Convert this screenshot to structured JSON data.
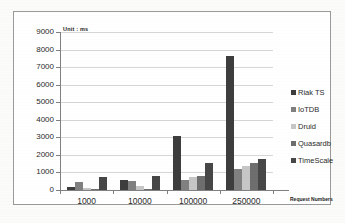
{
  "chart_data": {
    "type": "bar",
    "title": "",
    "subtitle": "",
    "unit_note": "Unit : ms",
    "xlabel": "Request Numbers",
    "ylabel": "",
    "ylim": [
      0,
      9000
    ],
    "ytick_step": 1000,
    "grid": true,
    "legend_position": "right",
    "categories": [
      "1000",
      "10000",
      "100000",
      "250000"
    ],
    "ytick_labels": [
      "9000",
      "8000",
      "7000",
      "6000",
      "5000",
      "4000",
      "3000",
      "2000",
      "1000",
      "0"
    ],
    "ytick_values": [
      9000,
      8000,
      7000,
      6000,
      5000,
      4000,
      3000,
      2000,
      1000,
      0
    ],
    "series": [
      {
        "name": "Riak TS",
        "color": "#3d3d3d",
        "values": [
          150,
          550,
          3050,
          7620
        ]
      },
      {
        "name": "IoTDB",
        "color": "#808080",
        "values": [
          480,
          490,
          580,
          1210
        ]
      },
      {
        "name": "Druid",
        "color": "#c6c6c6",
        "values": [
          100,
          240,
          760,
          1340
        ]
      },
      {
        "name": "Quasardb",
        "color": "#6e6e6e",
        "values": [
          10,
          50,
          780,
          1550
        ]
      },
      {
        "name": "TimeScale",
        "color": "#474747",
        "values": [
          730,
          800,
          1530,
          1790
        ]
      }
    ]
  },
  "legend": {
    "items": [
      {
        "label": "Riak TS",
        "color": "#3d3d3d"
      },
      {
        "label": "IoTDB",
        "color": "#808080"
      },
      {
        "label": "Druid",
        "color": "#c6c6c6"
      },
      {
        "label": "Quasardb",
        "color": "#6e6e6e"
      },
      {
        "label": "TimeScale",
        "color": "#474747"
      }
    ]
  }
}
